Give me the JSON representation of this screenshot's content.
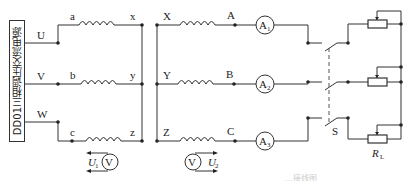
{
  "source": {
    "label": "DD01三相调压交流电源",
    "terminals": [
      "U",
      "V",
      "W"
    ]
  },
  "primary_windings": {
    "start_labels": [
      "a",
      "b",
      "c"
    ],
    "end_labels": [
      "x",
      "y",
      "z"
    ]
  },
  "secondary_windings": {
    "start_labels": [
      "X",
      "Y",
      "Z"
    ],
    "end_labels": [
      "A",
      "B",
      "C"
    ]
  },
  "ammeters": [
    {
      "symbol": "A",
      "sub": "1"
    },
    {
      "symbol": "A",
      "sub": "2"
    },
    {
      "symbol": "A",
      "sub": "3"
    }
  ],
  "voltmeters": [
    {
      "symbol": "V",
      "measure": "U",
      "sub": "1"
    },
    {
      "symbol": "V",
      "measure": "U",
      "sub": "2"
    }
  ],
  "switch": {
    "label": "S"
  },
  "load": {
    "label": "R",
    "sub": "L"
  },
  "caption": "…接线图"
}
